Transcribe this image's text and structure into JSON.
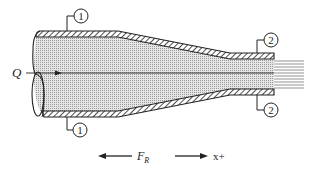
{
  "figure": {
    "colors": {
      "stroke": "#222222",
      "fluid_fill": "#d8d8d8",
      "background": "#ffffff"
    }
  },
  "labels": {
    "flow_rate": "Q",
    "section_inlet_top": "1",
    "section_inlet_bottom": "1",
    "section_outlet_top": "2",
    "section_outlet_bottom": "2",
    "reaction_force": "F",
    "reaction_force_sub": "R",
    "positive_direction": "x+"
  }
}
